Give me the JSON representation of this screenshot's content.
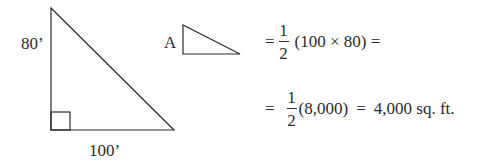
{
  "figure": {
    "large_triangle": {
      "vertical_side_label": "80’",
      "horizontal_side_label": "100’",
      "right_angle_marker": true
    },
    "small_triangle": {
      "label": "A"
    }
  },
  "equations": [
    {
      "prefix": "=",
      "fraction": {
        "numerator": "1",
        "denominator": "2"
      },
      "expression": "(100 × 80) ="
    },
    {
      "prefix": "=",
      "fraction": {
        "numerator": "1",
        "denominator": "2"
      },
      "expression": "(8,000)",
      "equals": "=",
      "result": "4,000 sq. ft."
    }
  ],
  "colors": {
    "stroke": "#2a2a2a",
    "background": "#ffffff"
  }
}
